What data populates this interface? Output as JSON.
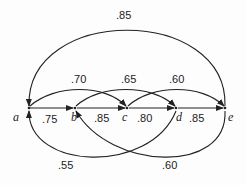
{
  "diagram": {
    "type": "directed-graph",
    "nodes": [
      {
        "id": "a",
        "label": "a",
        "x": 29,
        "y": 108
      },
      {
        "id": "b",
        "label": "b",
        "x": 75,
        "y": 108
      },
      {
        "id": "c",
        "label": "c",
        "x": 127,
        "y": 108
      },
      {
        "id": "d",
        "label": "d",
        "x": 176,
        "y": 108
      },
      {
        "id": "e",
        "label": "e",
        "x": 225,
        "y": 108
      }
    ],
    "edges": [
      {
        "from": "a",
        "to": "b",
        "weight": ".75"
      },
      {
        "from": "b",
        "to": "c",
        "weight": ".85"
      },
      {
        "from": "c",
        "to": "d",
        "weight": ".80"
      },
      {
        "from": "d",
        "to": "e",
        "weight": ".85"
      },
      {
        "from": "a",
        "to": "c",
        "weight": ".70"
      },
      {
        "from": "b",
        "to": "d",
        "weight": ".65"
      },
      {
        "from": "c",
        "to": "e",
        "weight": ".60"
      },
      {
        "from": "e",
        "to": "a",
        "weight": ".85"
      },
      {
        "from": "d",
        "to": "a",
        "weight": ".55"
      },
      {
        "from": "e",
        "to": "b",
        "weight": ".60"
      }
    ]
  }
}
